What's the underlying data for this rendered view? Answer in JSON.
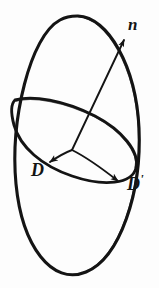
{
  "figure": {
    "background_color": "#fdfdfd",
    "stroke_color": "#141414",
    "labels": {
      "normal_vector": "n",
      "vector_d": "D",
      "vector_d_prime_base": "D",
      "vector_d_prime_mark": "'"
    },
    "geometry": {
      "outer_ellipse": {
        "name": "large-tilted-ellipse",
        "center_x": 78,
        "center_y": 148,
        "radius_x": 62,
        "radius_y": 132,
        "rotation_deg": 10
      },
      "inner_ellipse": {
        "name": "inner-disk-ellipse",
        "center_x": 77,
        "center_y": 143,
        "radius_x": 63,
        "radius_y": 27,
        "rotation_deg": 24
      },
      "vertex": {
        "x": 72,
        "y": 150
      },
      "normal_arrow": {
        "from_x": 72,
        "from_y": 150,
        "to_x": 126,
        "to_y": 36
      },
      "d_arrow": {
        "from_x": 72,
        "from_y": 150,
        "to_x": 47,
        "to_y": 163
      },
      "d_prime_arrow": {
        "from_x": 72,
        "from_y": 150,
        "to_x": 124,
        "to_y": 185
      }
    }
  }
}
